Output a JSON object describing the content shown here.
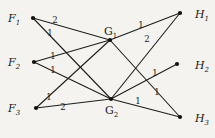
{
  "diagram": {
    "type": "bipartite-weighted-graph",
    "nodes": [
      {
        "id": "F1",
        "letter": "F",
        "sub": "1",
        "x": 33,
        "y": 18,
        "label_x": 8,
        "label_y": 22,
        "style": "italic"
      },
      {
        "id": "F2",
        "letter": "F",
        "sub": "2",
        "x": 34,
        "y": 62,
        "label_x": 8,
        "label_y": 66,
        "style": "italic"
      },
      {
        "id": "F3",
        "letter": "F",
        "sub": "3",
        "x": 36,
        "y": 108,
        "label_x": 8,
        "label_y": 112,
        "style": "italic"
      },
      {
        "id": "G1",
        "letter": "G",
        "sub": "1",
        "x": 110,
        "y": 40,
        "label_x": 104,
        "label_y": 35,
        "style": "upright"
      },
      {
        "id": "G2",
        "letter": "G",
        "sub": "2",
        "x": 111,
        "y": 99,
        "label_x": 105,
        "label_y": 114,
        "style": "upright"
      },
      {
        "id": "H1",
        "letter": "H",
        "sub": "1",
        "x": 180,
        "y": 13,
        "label_x": 195,
        "label_y": 18,
        "style": "italic"
      },
      {
        "id": "H2",
        "letter": "H",
        "sub": "2",
        "x": 177,
        "y": 64,
        "label_x": 195,
        "label_y": 69,
        "style": "italic"
      },
      {
        "id": "H3",
        "letter": "H",
        "sub": "3",
        "x": 180,
        "y": 117,
        "label_x": 195,
        "label_y": 122,
        "style": "italic"
      }
    ],
    "edges": [
      {
        "from": "F1",
        "to": "G1",
        "weight": "2",
        "wx": 55,
        "wy": 23
      },
      {
        "from": "F1",
        "to": "G2",
        "weight": "1",
        "wx": 50,
        "wy": 36
      },
      {
        "from": "F2",
        "to": "G1",
        "weight": "1",
        "wx": 53,
        "wy": 59
      },
      {
        "from": "F2",
        "to": "G2",
        "weight": "1",
        "wx": 53,
        "wy": 73
      },
      {
        "from": "F3",
        "to": "G1",
        "weight": "1",
        "wx": 49,
        "wy": 100
      },
      {
        "from": "F3",
        "to": "G2",
        "weight": "2",
        "wx": 63,
        "wy": 110
      },
      {
        "from": "G1",
        "to": "H1",
        "weight": "1",
        "wx": 141,
        "wy": 28
      },
      {
        "from": "G1",
        "to": "H3",
        "weight": "1",
        "wx": 157,
        "wy": 95
      },
      {
        "from": "G2",
        "to": "H1",
        "weight": "2",
        "wx": 147,
        "wy": 42
      },
      {
        "from": "G2",
        "to": "H2",
        "weight": "1",
        "wx": 155,
        "wy": 76
      },
      {
        "from": "G2",
        "to": "H3",
        "weight": "1",
        "wx": 138,
        "wy": 104
      }
    ]
  }
}
